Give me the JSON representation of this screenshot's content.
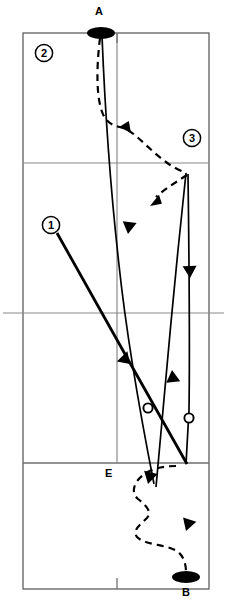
{
  "diagram": {
    "type": "trajectory-schematic",
    "title": "",
    "background_color": "#ffffff",
    "line_color": "#000000",
    "grid_color": "#6b6b6b",
    "frame": {
      "left": 23,
      "top": 33,
      "right": 209,
      "bottom": 589,
      "horizontal_lines": [
        163,
        313,
        463
      ],
      "vertical_lines": [
        117
      ],
      "center_line_overhang_left": 8,
      "center_line_overhang_right": 8
    },
    "endpoints": [
      {
        "id": "A",
        "label": "A",
        "label_position": "above",
        "marker": "filled-ellipse",
        "x": 101,
        "y": 33,
        "rx": 14,
        "ry": 6
      },
      {
        "id": "B",
        "label": "B",
        "label_position": "below",
        "marker": "filled-ellipse",
        "x": 186,
        "y": 577,
        "rx": 14,
        "ry": 6
      }
    ],
    "callouts": [
      {
        "id": "callout-1",
        "label": "1",
        "cx": 51,
        "cy": 225,
        "r": 9,
        "leader_to_x": 130,
        "leader_to_y": 360
      },
      {
        "id": "callout-2",
        "label": "2",
        "cx": 44,
        "cy": 53,
        "r": 9,
        "leader_to_x": null,
        "leader_to_y": null
      },
      {
        "id": "callout-3",
        "label": "3",
        "cx": 192,
        "cy": 138,
        "r": 9,
        "leader_to_x": null,
        "leader_to_y": null
      }
    ],
    "point_labels": [
      {
        "id": "E",
        "label": "E",
        "x": 113,
        "y": 473,
        "anchor": "end"
      }
    ],
    "open_circles": [
      {
        "id": "open-circle-left",
        "cx": 148,
        "cy": 408,
        "r": 5
      },
      {
        "id": "open-circle-right",
        "cx": 189,
        "cy": 418,
        "r": 5
      }
    ],
    "paths": [
      {
        "id": "solid-path-main",
        "style": "solid",
        "stroke_width": 1.6,
        "description": "From A descending through frame, bending to lower-left then down to E",
        "points": "101,33 106,120 112,200 120,290 134,380 152,470 156,486"
      },
      {
        "id": "solid-path-callout-1",
        "style": "solid",
        "stroke_width": 2.6,
        "description": "Thick straight line from callout 1 down-right through open circle to lower area",
        "points": "57,232 130,362 186,464"
      },
      {
        "id": "solid-path-up",
        "style": "solid",
        "stroke_width": 1.6,
        "description": "Rising solid line from lower area up to the 3 region",
        "points": "155,486 166,400 175,300 183,200 186,172"
      },
      {
        "id": "solid-path-down-right",
        "style": "solid",
        "stroke_width": 1.6,
        "description": "Descending solid line on the right from 3 region to lower area",
        "points": "188,172 189,260 190,340 189,418 186,464"
      },
      {
        "id": "dashed-path-top",
        "style": "dashed",
        "stroke_width": 2.2,
        "description": "Dashed path from A curving down, right to callout 3",
        "points": "100,36 98,90 104,118 112,126 126,128 146,150 170,165 186,172"
      },
      {
        "id": "dashed-path-3-left",
        "style": "dashed",
        "stroke_width": 2.2,
        "description": "Dashed branch leaving 3 to the left-down",
        "points": "186,174 172,182 158,193 148,203"
      },
      {
        "id": "dashed-path-bottom",
        "style": "dashed",
        "stroke_width": 2.2,
        "description": "Dashed serpentine path from E down to B",
        "points": "174,466 160,468 146,472 136,482 134,494 144,500 152,508 148,518 136,524 134,534 146,540 164,544 178,548 184,558 186,570"
      }
    ],
    "arrowheads": [
      {
        "id": "arrow-dashed-top",
        "x": 125,
        "y": 128,
        "angle": 125,
        "size": 10
      },
      {
        "id": "arrow-dashed-3left",
        "x": 150,
        "y": 204,
        "angle": 215,
        "size": 10
      },
      {
        "id": "arrow-solid-down-1",
        "x": 128,
        "y": 231,
        "angle": 95,
        "size": 10
      },
      {
        "id": "arrow-solid-right-dn",
        "x": 190,
        "y": 272,
        "angle": 92,
        "size": 10
      },
      {
        "id": "arrow-thick-1",
        "x": 131,
        "y": 362,
        "angle": 60,
        "size": 11
      },
      {
        "id": "arrow-solid-up",
        "x": 171,
        "y": 374,
        "angle": 275,
        "size": 10
      },
      {
        "id": "arrow-dashed-E",
        "x": 148,
        "y": 478,
        "angle": 100,
        "size": 10
      },
      {
        "id": "arrow-dashed-lower",
        "x": 186,
        "y": 525,
        "angle": 75,
        "size": 10
      }
    ]
  }
}
